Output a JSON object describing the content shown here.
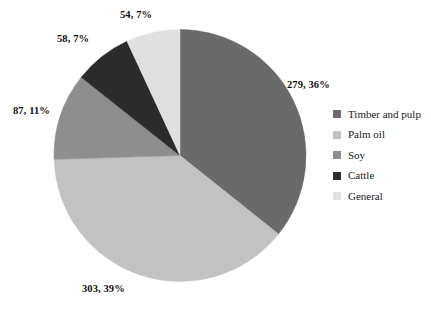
{
  "chart_data": {
    "type": "pie",
    "title": "",
    "xlabel": "",
    "ylabel": "",
    "grid": false,
    "legend_position": "right",
    "total": 781,
    "start_angle_deg": 0,
    "direction": "clockwise",
    "categories": [
      "Timber and pulp",
      "Palm oil",
      "Soy",
      "Cattle",
      "General"
    ],
    "values": [
      279,
      303,
      87,
      58,
      54
    ],
    "percentages": [
      36,
      39,
      11,
      7,
      7
    ],
    "colors": [
      "#6a6a6a",
      "#c2c2c2",
      "#8e8e8e",
      "#2b2b2b",
      "#e0e0e0"
    ],
    "data_labels": [
      "279, 36%",
      "303, 39%",
      "87, 11%",
      "58, 7%",
      "54, 7%"
    ],
    "slices": [
      {
        "label": "Timber and pulp",
        "value": 279,
        "percent": 36,
        "color": "#6a6a6a",
        "data_label": "279, 36%"
      },
      {
        "label": "Palm oil",
        "value": 303,
        "percent": 39,
        "color": "#c2c2c2",
        "data_label": "303, 39%"
      },
      {
        "label": "Soy",
        "value": 87,
        "percent": 11,
        "color": "#8e8e8e",
        "data_label": "87, 11%"
      },
      {
        "label": "Cattle",
        "value": 58,
        "percent": 7,
        "color": "#2b2b2b",
        "data_label": "58, 7%"
      },
      {
        "label": "General",
        "value": 54,
        "percent": 7,
        "color": "#e0e0e0",
        "data_label": "54, 7%"
      }
    ]
  },
  "legend": {
    "items": [
      {
        "label": "Timber and pulp",
        "color": "#6a6a6a"
      },
      {
        "label": "Palm oil",
        "color": "#c2c2c2"
      },
      {
        "label": "Soy",
        "color": "#8e8e8e"
      },
      {
        "label": "Cattle",
        "color": "#2b2b2b"
      },
      {
        "label": "General",
        "color": "#e0e0e0"
      }
    ]
  }
}
